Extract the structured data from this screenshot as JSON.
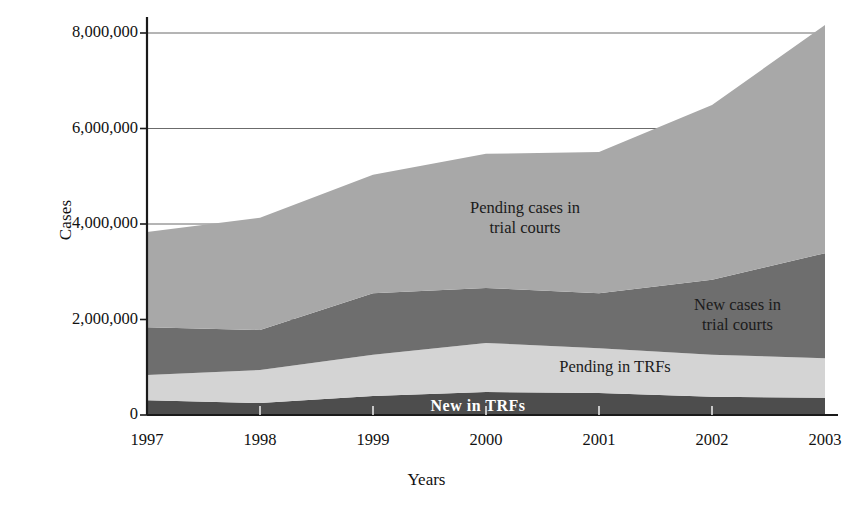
{
  "chart_data": {
    "type": "area",
    "title": "",
    "xlabel": "Years",
    "ylabel": "Cases",
    "categories": [
      "1997",
      "1998",
      "1999",
      "2000",
      "2001",
      "2002",
      "2003"
    ],
    "x": [
      1997,
      1998,
      1999,
      2000,
      2001,
      2002,
      2003
    ],
    "ylim": [
      0,
      8000000
    ],
    "xlim": [
      1997,
      2003
    ],
    "ytick_labels": [
      "0",
      "2,000,000",
      "4,000,000",
      "6,000,000",
      "8,000,000"
    ],
    "ytick_values": [
      0,
      2000000,
      4000000,
      6000000,
      8000000
    ],
    "grid": "horizontal",
    "legend_position": "inline-annotations",
    "stacked": true,
    "series": [
      {
        "name": "New in TRFs",
        "color": "#4d4d4d",
        "label_color": "#ffffff",
        "values": [
          310000,
          250000,
          400000,
          480000,
          460000,
          380000,
          360000
        ]
      },
      {
        "name": "Pending in TRFs",
        "color": "#d4d4d4",
        "label_color": "#1b1b1b",
        "values": [
          530000,
          690000,
          860000,
          1030000,
          940000,
          880000,
          830000
        ]
      },
      {
        "name": "New cases in trial courts",
        "color": "#6e6e6e",
        "label_color": "#1b1b1b",
        "values": [
          1000000,
          840000,
          1290000,
          1150000,
          1150000,
          1570000,
          2200000
        ]
      },
      {
        "name": "Pending cases in trial courts",
        "color": "#a8a8a8",
        "label_color": "#1b1b1b",
        "values": [
          1990000,
          2350000,
          2480000,
          2810000,
          2960000,
          3660000,
          4780000
        ]
      }
    ],
    "cumulative_tops": {
      "New in TRFs": [
        310000,
        250000,
        400000,
        480000,
        460000,
        380000,
        360000
      ],
      "Pending in TRFs": [
        840000,
        940000,
        1260000,
        1510000,
        1400000,
        1260000,
        1190000
      ],
      "New cases in trial courts": [
        1840000,
        1780000,
        2550000,
        2660000,
        2550000,
        2830000,
        3390000
      ],
      "Pending cases in trial courts": [
        3830000,
        4130000,
        5030000,
        5470000,
        5510000,
        6490000,
        8170000
      ]
    },
    "annotations": [
      {
        "text": "Pending cases in\ntrial courts",
        "series": "Pending cases in trial courts"
      },
      {
        "text": "New cases in\ntrial courts",
        "series": "New cases in trial courts"
      },
      {
        "text": "Pending in TRFs",
        "series": "Pending in TRFs"
      },
      {
        "text": "New in TRFs",
        "series": "New in TRFs"
      }
    ]
  },
  "axes": {
    "y_title": "Cases",
    "x_title": "Years"
  },
  "ticks": {
    "y": [
      {
        "label": "8,000,000",
        "value": 8000000
      },
      {
        "label": "6,000,000",
        "value": 6000000
      },
      {
        "label": "4,000,000",
        "value": 4000000
      },
      {
        "label": "2,000,000",
        "value": 2000000
      },
      {
        "label": "0",
        "value": 0
      }
    ],
    "x": [
      {
        "label": "1997"
      },
      {
        "label": "1998"
      },
      {
        "label": "1999"
      },
      {
        "label": "2000"
      },
      {
        "label": "2001"
      },
      {
        "label": "2002"
      },
      {
        "label": "2003"
      }
    ]
  },
  "annotations": {
    "pending_trial": "Pending cases in\ntrial courts",
    "new_trial": "New cases in\ntrial courts",
    "pending_trf": "Pending in TRFs",
    "new_trf": "New in TRFs"
  },
  "colors": {
    "pending_trial": "#a8a8a8",
    "new_trial": "#6e6e6e",
    "pending_trf": "#d4d4d4",
    "new_trf": "#4d4d4d",
    "axis": "#1a1a1a",
    "grid": "#6b6b6b",
    "background": "#ffffff"
  }
}
